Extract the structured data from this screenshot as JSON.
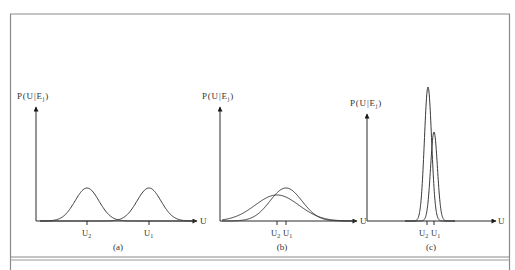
{
  "figure": {
    "frame_color": "#8a8a8a",
    "curve_color": "#3a3a3a",
    "axis_color": "#2a2a2a",
    "y_axis_label": "P(U|E",
    "y_axis_label_sub": "j",
    "y_axis_label_close": ")",
    "x_axis_label": "U",
    "u1_label": "U",
    "u1_sub": "1",
    "u2_label": "U",
    "u2_sub": "2"
  },
  "panels": [
    {
      "caption": "(a)",
      "description": "Two well-separated equal-variance distributions"
    },
    {
      "caption": "(b)",
      "description": "Two heavily overlapping broad distributions"
    },
    {
      "caption": "(c)",
      "description": "Two narrow distributions with close means"
    }
  ],
  "chart_data": [
    {
      "type": "line",
      "title": "(a)",
      "xlabel": "U",
      "ylabel": "P(U|Ej)",
      "series": [
        {
          "name": "U2",
          "mean": 87,
          "peak_height": 33,
          "sigma": 12
        },
        {
          "name": "U1",
          "mean": 149,
          "peak_height": 33,
          "sigma": 12
        }
      ],
      "ticks": [
        "U2",
        "U1"
      ]
    },
    {
      "type": "line",
      "title": "(b)",
      "xlabel": "U",
      "ylabel": "P(U|Ej)",
      "series": [
        {
          "name": "U2",
          "mean": 277,
          "peak_height": 26,
          "sigma": 22
        },
        {
          "name": "U1",
          "mean": 286,
          "peak_height": 33,
          "sigma": 16
        }
      ],
      "ticks": [
        "U2",
        "U1"
      ]
    },
    {
      "type": "line",
      "title": "(c)",
      "xlabel": "U",
      "ylabel": "P(U|Ej)",
      "series": [
        {
          "name": "U2",
          "mean": 428,
          "peak_height": 134,
          "sigma": 3.6
        },
        {
          "name": "U1",
          "mean": 434,
          "peak_height": 89,
          "sigma": 3.4
        }
      ],
      "ticks": [
        "U2",
        "U1"
      ]
    }
  ]
}
